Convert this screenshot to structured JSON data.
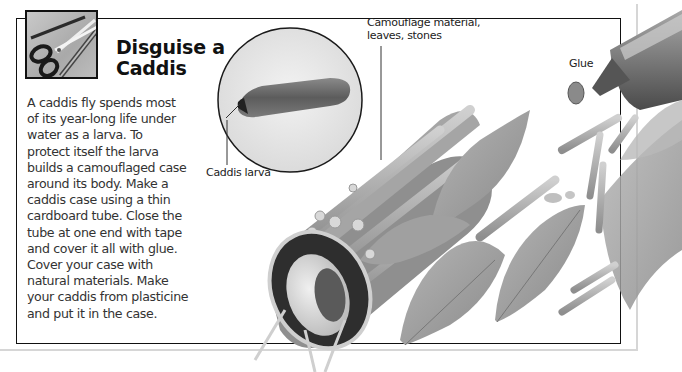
{
  "activity": {
    "title_line1": "Disguise a",
    "title_line2": "Caddis",
    "icon": "scissors-pencil-icon",
    "body_lines": [
      "A caddis fly spends most",
      "of its year-long life under",
      "water as a larva. To",
      "protect itself the larva",
      "builds a camouflaged case",
      "around its body. Make a",
      "caddis case using a thin",
      "cardboard tube. Close the",
      "tube at one end with tape",
      "and cover it all with glue.",
      "Cover your case with",
      "natural materials. Make",
      "your caddis from plasticine",
      "and put it in the case."
    ]
  },
  "labels": {
    "caddis_larva": "Caddis larva",
    "camouflage_line1": "Camouflage material,",
    "camouflage_line2": "leaves, stones",
    "glue": "Glue"
  },
  "illustrations": {
    "larva_photo": "caddis-larva-circle-photo",
    "tube": "camouflaged-cardboard-tube",
    "glue_tube": "glue-tube",
    "loose_materials": "leaves-and-twigs"
  },
  "colors": {
    "frame": "#111111",
    "outer_frame": "#d6d6d6",
    "text": "#333333",
    "illustration_gray": "#9a9a9a"
  }
}
